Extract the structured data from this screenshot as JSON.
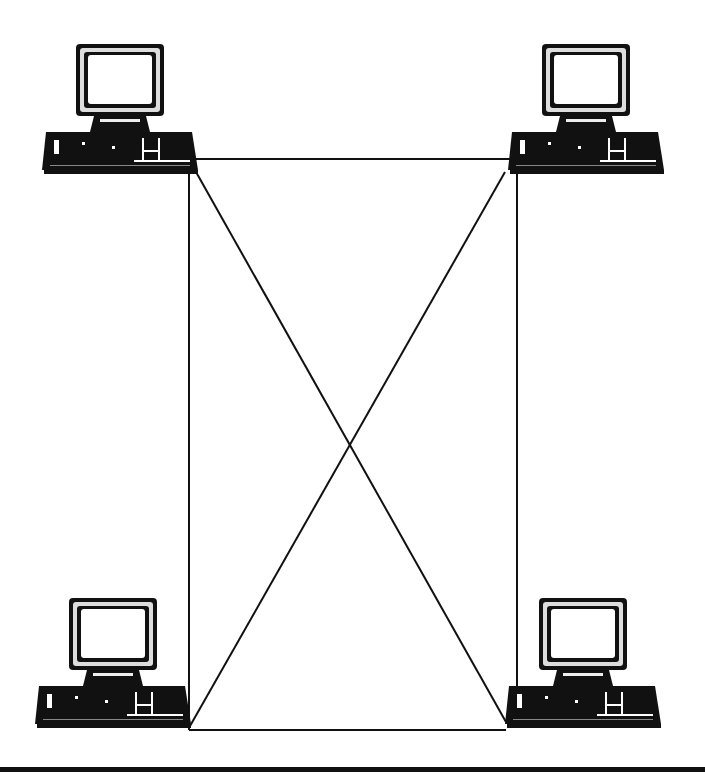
{
  "diagram": {
    "type": "network-topology",
    "topology": "full-mesh",
    "nodes": [
      {
        "id": "pc-top-left",
        "icon": "desktop-computer-icon",
        "x": 120,
        "y": 110
      },
      {
        "id": "pc-top-right",
        "icon": "desktop-computer-icon",
        "x": 586,
        "y": 110
      },
      {
        "id": "pc-bottom-left",
        "icon": "desktop-computer-icon",
        "x": 113,
        "y": 664
      },
      {
        "id": "pc-bottom-right",
        "icon": "desktop-computer-icon",
        "x": 583,
        "y": 664
      }
    ],
    "links": [
      {
        "from": "pc-top-left",
        "to": "pc-top-right"
      },
      {
        "from": "pc-top-left",
        "to": "pc-bottom-left"
      },
      {
        "from": "pc-top-left",
        "to": "pc-bottom-right"
      },
      {
        "from": "pc-top-right",
        "to": "pc-bottom-left"
      },
      {
        "from": "pc-top-right",
        "to": "pc-bottom-right"
      },
      {
        "from": "pc-bottom-left",
        "to": "pc-bottom-right"
      }
    ],
    "colors": {
      "line": "#111111",
      "background": "#ffffff"
    }
  }
}
